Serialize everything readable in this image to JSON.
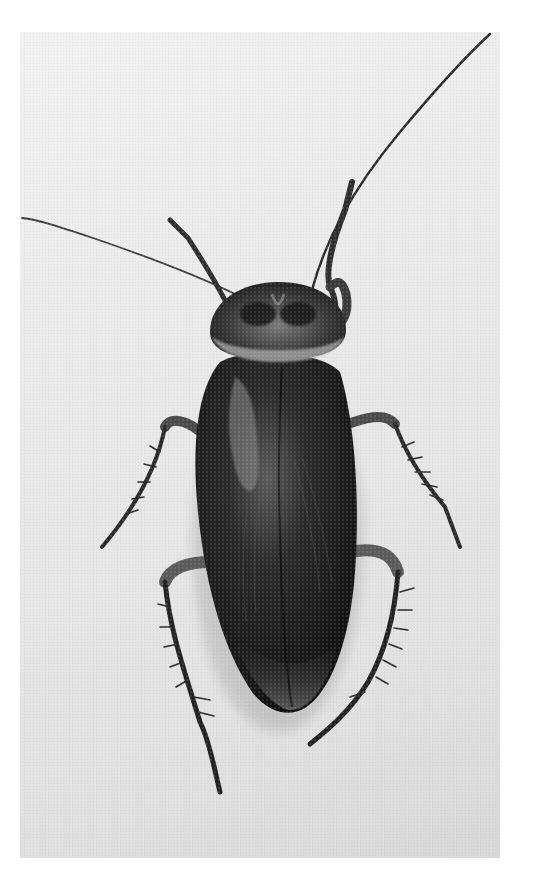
{
  "image": {
    "kind": "photograph",
    "subject": "cockroach",
    "view": "dorsal (top-down)",
    "color_mode": "grayscale",
    "frame": {
      "x": 20,
      "y": 32,
      "width": 480,
      "height": 826
    },
    "colors": {
      "page_background": "#ffffff",
      "photo_background": "#e9e9e8",
      "body_dark": "#141414",
      "body_mid": "#3a3a3a",
      "pronotum_highlight": "#9a9a9a"
    }
  }
}
